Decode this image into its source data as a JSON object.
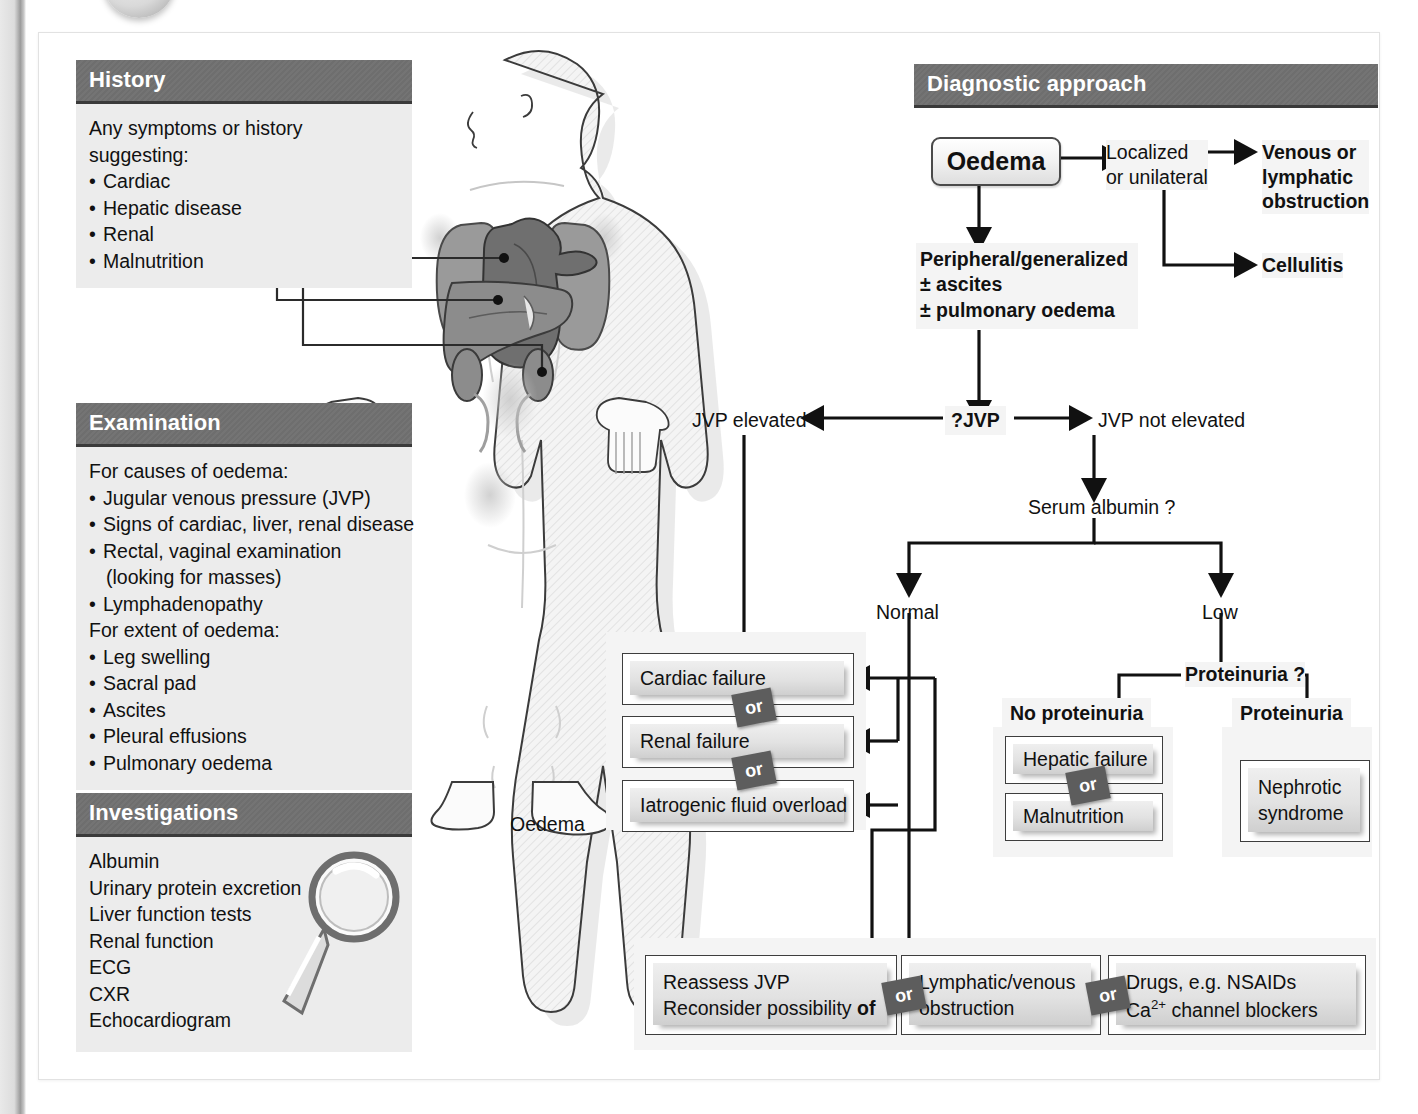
{
  "panels": {
    "history": {
      "title": "History",
      "lines": [
        {
          "text": "Any symptoms or history",
          "bullet": false
        },
        {
          "text": "suggesting:",
          "bullet": false
        },
        {
          "text": "Cardiac",
          "bullet": true
        },
        {
          "text": "Hepatic disease",
          "bullet": true
        },
        {
          "text": "Renal",
          "bullet": true
        },
        {
          "text": "Malnutrition",
          "bullet": true
        }
      ]
    },
    "examination": {
      "title": "Examination",
      "lines": [
        {
          "text": "For causes of oedema:",
          "bullet": false
        },
        {
          "text": "Jugular venous pressure (JVP)",
          "bullet": true
        },
        {
          "text": "Signs of cardiac, liver, renal disease",
          "bullet": true
        },
        {
          "text": "Rectal, vaginal examination",
          "bullet": true
        },
        {
          "text": "(looking for masses)",
          "bullet": false,
          "indent": true
        },
        {
          "text": "Lymphadenopathy",
          "bullet": true
        },
        {
          "text": "For extent of oedema:",
          "bullet": false
        },
        {
          "text": "Leg swelling",
          "bullet": true
        },
        {
          "text": "Sacral pad",
          "bullet": true
        },
        {
          "text": "Ascites",
          "bullet": true
        },
        {
          "text": "Pleural effusions",
          "bullet": true
        },
        {
          "text": "Pulmonary oedema",
          "bullet": true
        }
      ]
    },
    "investigations": {
      "title": "Investigations",
      "lines": [
        {
          "text": "Albumin",
          "bullet": false
        },
        {
          "text": "Urinary protein excretion",
          "bullet": false
        },
        {
          "text": "Liver function tests",
          "bullet": false
        },
        {
          "text": "Renal function",
          "bullet": false
        },
        {
          "text": "ECG",
          "bullet": false
        },
        {
          "text": "CXR",
          "bullet": false
        },
        {
          "text": "Echocardiogram",
          "bullet": false
        }
      ]
    },
    "diagnostic": {
      "title": "Diagnostic approach"
    }
  },
  "figure": {
    "caption": "Oedema"
  },
  "flow": {
    "oedema": "Oedema",
    "localized_line1": "Localized",
    "localized_line2": "or unilateral",
    "venous_line1": "Venous or",
    "venous_line2": "lymphatic",
    "venous_line3": "obstruction",
    "cellulitis": "Cellulitis",
    "peripheral_line1": "Peripheral/generalized",
    "peripheral_line2": "± ascites",
    "peripheral_line3": "± pulmonary oedema",
    "jvp_question": "?JVP",
    "jvp_elevated": "JVP elevated",
    "jvp_not_elevated": "JVP not elevated",
    "serum_albumin": "Serum albumin ?",
    "normal": "Normal",
    "low": "Low",
    "proteinuria_question": "Proteinuria ?",
    "no_proteinuria": "No proteinuria",
    "proteinuria_line1": "Proteinuria",
    "proteinuria_line2": ">4.5 g/24 h",
    "or_label": "or"
  },
  "boxes": {
    "cardiac_failure": "Cardiac failure",
    "renal_failure": "Renal failure",
    "iatrogenic": "Iatrogenic fluid overload",
    "hepatic_failure": "Hepatic failure",
    "malnutrition": "Malnutrition",
    "nephrotic_line1": "Nephrotic",
    "nephrotic_line2": "syndrome",
    "reassess_line1": "Reassess JVP",
    "reassess_line2a": "Reconsider possibility ",
    "reassess_line2b": "of",
    "lymphatic_line1": "Lymphatic/venous",
    "lymphatic_line2": "obstruction",
    "drugs_line1": "Drugs, e.g. NSAIDs",
    "drugs_line2a": "Ca",
    "drugs_line2sup": "2+",
    "drugs_line2b": " channel blockers"
  },
  "colors": {
    "header_bar": "#6e6e6e",
    "header_underline": "#3a3a3a",
    "panel_body": "#ececec",
    "box_fill": "#e4e4e4",
    "line": "#111111",
    "or_badge": "#5d5d5d"
  }
}
